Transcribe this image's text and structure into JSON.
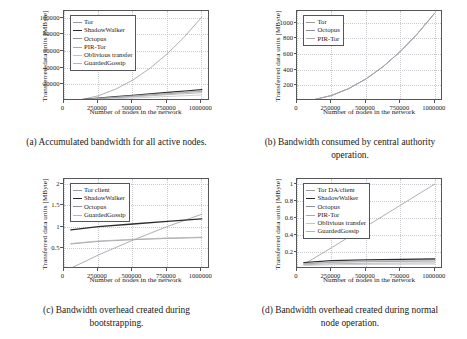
{
  "figure": {
    "axis_label_x": "Number of nodes in the network",
    "axis_label_y": "Transferred data units [MByte]"
  },
  "colors": {
    "tor": "#9b9b9b",
    "shadowwalker": "#2b2b2b",
    "octopus": "#8f9094",
    "pir_tor": "#a8a9ad",
    "oblivious": "#c2c3c7",
    "guardedgossip": "#b4b5b9",
    "axis": "#55565a",
    "grid": "#c9cacd"
  },
  "subfigures": [
    {
      "tag": "(a)",
      "caption_line1": "Accumulated bandwidth for all",
      "caption_line2": "active nodes.",
      "chart_data": {
        "type": "line",
        "title": "",
        "xlabel": "Number of nodes in the network",
        "ylabel": "Transferred data units [MByte]",
        "xlim": [
          0,
          1060000
        ],
        "ylim": [
          0,
          108000
        ],
        "xticks": [
          0,
          250000,
          500000,
          750000,
          1000000
        ],
        "xticklabels": [
          "0",
          "250000",
          "500000",
          "750000",
          "1000000"
        ],
        "yticks": [
          20000,
          40000,
          60000,
          80000,
          100000
        ],
        "yticklabels": [
          "20000",
          "40000",
          "60000",
          "80000",
          "100000"
        ],
        "grid": true,
        "legend_position": "upper left",
        "x": [
          0,
          125000,
          250000,
          375000,
          500000,
          625000,
          750000,
          875000,
          1000000
        ],
        "series": [
          {
            "name": "Tor",
            "color_key": "tor",
            "width": 0.8,
            "values": [
              0,
              1600,
              6300,
              14200,
              25200,
              39400,
              56700,
              77100,
              100700
            ]
          },
          {
            "name": "ShadowWalker",
            "color_key": "shadowwalker",
            "width": 1.3,
            "values": [
              0,
              1700,
              3400,
              5100,
              6800,
              8500,
              10200,
              11900,
              13600
            ]
          },
          {
            "name": "Octopus",
            "color_key": "octopus",
            "width": 0.8,
            "values": [
              0,
              1450,
              2900,
              4350,
              5800,
              7250,
              8700,
              10150,
              11600
            ]
          },
          {
            "name": "PIR-Tor",
            "color_key": "pir_tor",
            "width": 0.8,
            "values": [
              0,
              1250,
              2500,
              3750,
              5000,
              6250,
              7500,
              8750,
              10000
            ]
          },
          {
            "name": "Oblivious transfer",
            "color_key": "oblivious",
            "width": 0.8,
            "values": [
              0,
              900,
              1800,
              2700,
              3600,
              4500,
              5400,
              6300,
              7200
            ]
          },
          {
            "name": "GuardedGossip",
            "color_key": "guardedgossip",
            "width": 0.8,
            "values": [
              0,
              1550,
              3100,
              4650,
              6200,
              7750,
              9300,
              10850,
              12400
            ]
          }
        ]
      }
    },
    {
      "tag": "(b)",
      "caption_line1": "Bandwidth consumed by",
      "caption_line2": "central authority operation.",
      "chart_data": {
        "type": "line",
        "title": "",
        "xlabel": "Number of nodes in the network",
        "ylabel": "Transferred data units [MByte]",
        "xlim": [
          0,
          1060000
        ],
        "ylim": [
          0,
          1150
        ],
        "xticks": [
          0,
          250000,
          500000,
          750000,
          1000000
        ],
        "xticklabels": [
          "0",
          "250000",
          "500000",
          "750000",
          "1000000"
        ],
        "yticks": [
          200,
          400,
          600,
          800,
          1000
        ],
        "yticklabels": [
          "200",
          "400",
          "600",
          "800",
          "1000"
        ],
        "grid": true,
        "legend_position": "upper left",
        "x": [
          0,
          125000,
          250000,
          375000,
          500000,
          625000,
          750000,
          875000,
          1000000
        ],
        "series": [
          {
            "name": "Tor",
            "color_key": "tor",
            "width": 0.8,
            "values": [
              0,
              18,
              70,
              158,
              281,
              439,
              632,
              860,
              1123
            ]
          },
          {
            "name": "Octopus",
            "color_key": "octopus",
            "width": 0.8,
            "values": [
              0,
              18,
              70,
              158,
              281,
              439,
              632,
              860,
              1123
            ]
          },
          {
            "name": "PIR-Tor",
            "color_key": "pir_tor",
            "width": 0.8,
            "values": [
              0,
              18,
              70,
              158,
              281,
              439,
              632,
              860,
              1123
            ]
          }
        ]
      }
    },
    {
      "tag": "(c)",
      "caption_line1": "Bandwidth overhead created",
      "caption_line2": "during bootstrapping.",
      "chart_data": {
        "type": "line",
        "title": "",
        "xlabel": "Number of nodes in the network",
        "ylabel": "Transferred data units [MByte]",
        "xlim": [
          0,
          1060000
        ],
        "ylim": [
          0,
          2.12
        ],
        "xticks": [
          0,
          250000,
          500000,
          750000,
          1000000
        ],
        "xticklabels": [
          "0",
          "250000",
          "500000",
          "750000",
          "1000000"
        ],
        "yticks": [
          0.5,
          1,
          1.5,
          2
        ],
        "yticklabels": [
          "0.5",
          "1",
          "1.5",
          "2"
        ],
        "grid": true,
        "legend_position": "upper left",
        "x": [
          50000,
          250000,
          500000,
          750000,
          1000000
        ],
        "series": [
          {
            "name": "Tor client",
            "color_key": "tor",
            "width": 0.8,
            "values": [
              0.02,
              0.33,
              0.68,
              1.0,
              1.29
            ]
          },
          {
            "name": "ShadowWalker",
            "color_key": "shadowwalker",
            "width": 1.3,
            "values": [
              0.92,
              1.0,
              1.06,
              1.12,
              1.18
            ]
          },
          {
            "name": "Octopus",
            "color_key": "octopus",
            "width": 0.8,
            "values": [
              0.59,
              0.65,
              0.69,
              0.72,
              0.74
            ]
          },
          {
            "name": "GuardedGossip",
            "color_key": "guardedgossip",
            "width": 0.8,
            "values": [
              0.6,
              0.66,
              0.7,
              0.73,
              0.75
            ]
          }
        ]
      }
    },
    {
      "tag": "(d)",
      "caption_line1": "Bandwidth overhead created",
      "caption_line2": "during normal node operation.",
      "chart_data": {
        "type": "line",
        "title": "",
        "xlabel": "Number of nodes in the network",
        "ylabel": "Transferred data units [MByte]",
        "xlim": [
          0,
          1060000
        ],
        "ylim": [
          0,
          1.06
        ],
        "xticks": [
          0,
          250000,
          500000,
          750000,
          1000000
        ],
        "xticklabels": [
          "0",
          "250000",
          "500000",
          "750000",
          "1000000"
        ],
        "yticks": [
          0.2,
          0.4,
          0.6,
          0.8,
          1
        ],
        "yticklabels": [
          "0.2",
          "0.4",
          "0.6",
          "0.8",
          "1"
        ],
        "grid": true,
        "legend_position": "upper left",
        "x": [
          50000,
          250000,
          500000,
          750000,
          1000000
        ],
        "series": [
          {
            "name": "Tor DA/client",
            "color_key": "tor",
            "width": 0.8,
            "values": [
              0.055,
              0.25,
              0.5,
              0.75,
              1.0
            ]
          },
          {
            "name": "ShadowWalker",
            "color_key": "shadowwalker",
            "width": 1.3,
            "values": [
              0.075,
              0.098,
              0.108,
              0.114,
              0.118
            ]
          },
          {
            "name": "Octopus",
            "color_key": "octopus",
            "width": 0.8,
            "values": [
              0.06,
              0.078,
              0.086,
              0.09,
              0.093
            ]
          },
          {
            "name": "PIR-Tor",
            "color_key": "pir_tor",
            "width": 0.8,
            "values": [
              0.05,
              0.062,
              0.067,
              0.07,
              0.072
            ]
          },
          {
            "name": "Oblivious transfer",
            "color_key": "oblivious",
            "width": 0.8,
            "values": [
              0.042,
              0.05,
              0.054,
              0.056,
              0.058
            ]
          },
          {
            "name": "GuardedGossip",
            "color_key": "guardedgossip",
            "width": 0.8,
            "values": [
              0.065,
              0.086,
              0.095,
              0.1,
              0.104
            ]
          }
        ]
      }
    }
  ]
}
